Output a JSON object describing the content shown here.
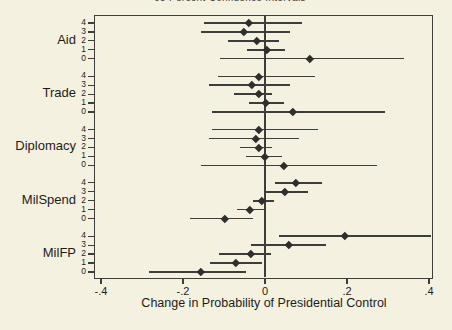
{
  "page": {
    "clipped_title": "95 Percent Confidence Intervals"
  },
  "colors": {
    "background": "#f5f1e0",
    "line": "#3d3d3b",
    "marker": "#2e2e2c",
    "text": "#1c1c1a"
  },
  "chart_data": {
    "type": "scatter",
    "subtype": "dot-with-horizontal-ci",
    "title_clipped_at_top": "95 Percent Confidence Intervals",
    "xlabel": "Change in Probability of Presidential Control",
    "xlim": [
      -0.41,
      0.41
    ],
    "xticks": [
      -0.4,
      -0.2,
      0,
      0.2,
      0.4
    ],
    "xtick_labels": [
      "-.4",
      "-.2",
      "0",
      ".2",
      ".4"
    ],
    "zero_reference_line": 0,
    "grid": false,
    "legend": "none",
    "row_order_top_to_bottom": [
      "4",
      "3",
      "2",
      "1",
      "0"
    ],
    "groups": [
      {
        "label": "Aid",
        "rows": [
          {
            "label": "4",
            "est": -0.04,
            "lo": -0.15,
            "hi": 0.09
          },
          {
            "label": "3",
            "est": -0.052,
            "lo": -0.155,
            "hi": 0.062
          },
          {
            "label": "2",
            "est": -0.02,
            "lo": -0.09,
            "hi": 0.033
          },
          {
            "label": "1",
            "est": 0.004,
            "lo": -0.045,
            "hi": 0.05
          },
          {
            "label": "0",
            "est": 0.11,
            "lo": -0.11,
            "hi": 0.34
          }
        ]
      },
      {
        "label": "Trade",
        "rows": [
          {
            "label": "4",
            "est": -0.016,
            "lo": -0.115,
            "hi": 0.122
          },
          {
            "label": "3",
            "est": -0.033,
            "lo": -0.136,
            "hi": 0.062
          },
          {
            "label": "2",
            "est": -0.016,
            "lo": -0.075,
            "hi": 0.016
          },
          {
            "label": "1",
            "est": 0.003,
            "lo": -0.038,
            "hi": 0.046
          },
          {
            "label": "0",
            "est": 0.069,
            "lo": -0.13,
            "hi": 0.293
          }
        ]
      },
      {
        "label": "Diplomacy",
        "rows": [
          {
            "label": "4",
            "est": -0.015,
            "lo": -0.129,
            "hi": 0.129
          },
          {
            "label": "3",
            "est": -0.023,
            "lo": -0.137,
            "hi": 0.082
          },
          {
            "label": "2",
            "est": -0.015,
            "lo": -0.061,
            "hi": 0.016
          },
          {
            "label": "1",
            "est": 0.0,
            "lo": -0.047,
            "hi": 0.042
          },
          {
            "label": "0",
            "est": 0.047,
            "lo": -0.156,
            "hi": 0.273
          }
        ]
      },
      {
        "label": "MilSpend",
        "rows": [
          {
            "label": "4",
            "est": 0.076,
            "lo": 0.024,
            "hi": 0.138
          },
          {
            "label": "3",
            "est": 0.048,
            "lo": 0.0,
            "hi": 0.104
          },
          {
            "label": "2",
            "est": -0.007,
            "lo": -0.029,
            "hi": 0.021
          },
          {
            "label": "1",
            "est": -0.036,
            "lo": -0.068,
            "hi": -0.002
          },
          {
            "label": "0",
            "est": -0.098,
            "lo": -0.184,
            "hi": -0.029
          }
        ]
      },
      {
        "label": "MilFP",
        "rows": [
          {
            "label": "4",
            "est": 0.195,
            "lo": 0.035,
            "hi": 0.404
          },
          {
            "label": "3",
            "est": 0.059,
            "lo": -0.033,
            "hi": 0.15
          },
          {
            "label": "2",
            "est": -0.035,
            "lo": -0.112,
            "hi": 0.014
          },
          {
            "label": "1",
            "est": -0.072,
            "lo": -0.135,
            "hi": -0.008
          },
          {
            "label": "0",
            "est": -0.157,
            "lo": -0.283,
            "hi": -0.047
          }
        ]
      }
    ]
  }
}
